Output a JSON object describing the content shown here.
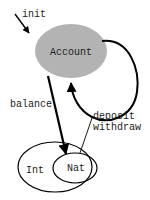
{
  "diagram": {
    "type": "state-diagram",
    "colors": {
      "account_fill": "#b3b3b3",
      "stroke": "#000000",
      "text": "#222222",
      "background": "#ffffff"
    },
    "nodes": {
      "account": {
        "label": "Account"
      },
      "int": {
        "label": "Int"
      },
      "nat": {
        "label": "Nat"
      }
    },
    "edges": {
      "init": {
        "label": "init"
      },
      "balance": {
        "label": "balance"
      },
      "self_loop": {
        "label_line1": "deposit",
        "label_line2": "withdraw"
      }
    }
  }
}
